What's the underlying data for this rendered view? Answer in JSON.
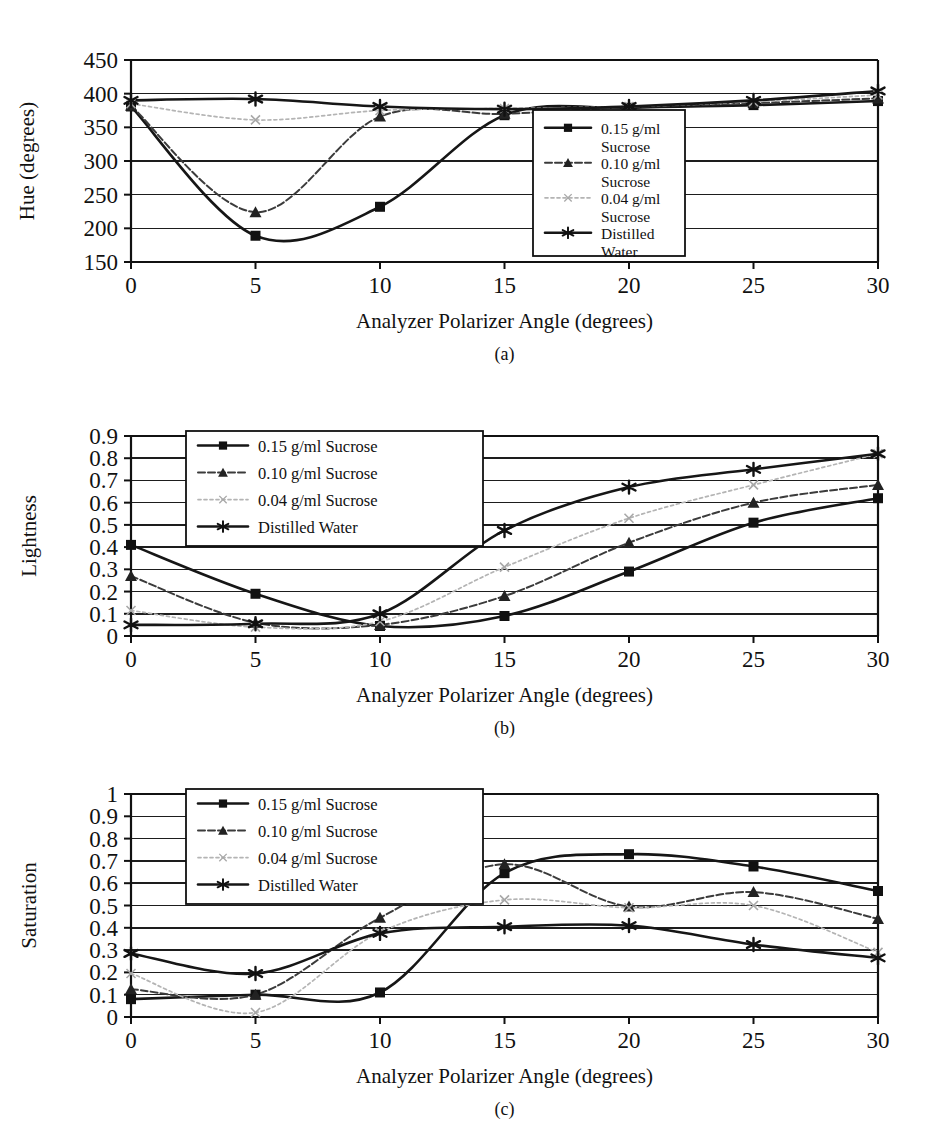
{
  "figure": {
    "x_axis_title": "Analyzer Polarizer Angle (degrees)",
    "x_ticks": [
      "0",
      "5",
      "10",
      "15",
      "20",
      "25",
      "30"
    ],
    "captions": {
      "a": "(a)",
      "b": "(b)",
      "c": "(c)"
    },
    "series_names": {
      "s015": "0.15 g/ml Sucrose",
      "s010": "0.10 g/ml Sucrose",
      "s004": "0.04 g/ml Sucrose",
      "water": "Distilled Water"
    },
    "series_names_wrapped": {
      "s015_l1": "0.15 g/ml",
      "s015_l2": "Sucrose",
      "s010_l1": "0.10 g/ml",
      "s010_l2": "Sucrose",
      "s004_l1": "0.04 g/ml",
      "s004_l2": "Sucrose",
      "water_l1": "Distilled",
      "water_l2": "Water"
    },
    "colors": {
      "s015": "#161616",
      "s010": "#3b3b3b",
      "s004": "#b4b4b4",
      "water": "#111111",
      "axis": "#111111",
      "grid": "#1d1d1d",
      "background": "#ffffff"
    },
    "markers": {
      "s015": "filled-square",
      "s010": "filled-triangle",
      "s004": "small-x",
      "water": "star-asterisk"
    }
  },
  "chart_data": [
    {
      "type": "line",
      "panel": "a",
      "title": "",
      "xlabel": "Analyzer Polarizer Angle (degrees)",
      "ylabel": "Hue (degrees)",
      "xlim": [
        0,
        30
      ],
      "ylim": [
        150,
        450
      ],
      "xticks": [
        0,
        5,
        10,
        15,
        20,
        25,
        30
      ],
      "yticks": [
        150,
        200,
        250,
        300,
        350,
        400,
        450
      ],
      "grid": true,
      "legend_position": "inside-right",
      "x": [
        0,
        5,
        10,
        15,
        20,
        25,
        30
      ],
      "series": [
        {
          "name": "0.15 g/ml Sucrose",
          "values": [
            381,
            189,
            232,
            368,
            379,
            383,
            389
          ]
        },
        {
          "name": "0.10 g/ml Sucrose",
          "values": [
            382,
            224,
            366,
            370,
            380,
            386,
            393
          ]
        },
        {
          "name": "0.04 g/ml Sucrose",
          "values": [
            385,
            361,
            375,
            378,
            381,
            388,
            398
          ]
        },
        {
          "name": "Distilled Water",
          "values": [
            390,
            392,
            381,
            377,
            381,
            390,
            404
          ]
        }
      ]
    },
    {
      "type": "line",
      "panel": "b",
      "title": "",
      "xlabel": "Analyzer Polarizer Angle (degrees)",
      "ylabel": "Lightness",
      "xlim": [
        0,
        30
      ],
      "ylim": [
        0,
        0.9
      ],
      "xticks": [
        0,
        5,
        10,
        15,
        20,
        25,
        30
      ],
      "yticks": [
        0,
        0.1,
        0.2,
        0.3,
        0.4,
        0.5,
        0.6,
        0.7,
        0.8,
        0.9
      ],
      "grid": true,
      "legend_position": "inside-top-left",
      "x": [
        0,
        5,
        10,
        15,
        20,
        25,
        30
      ],
      "series": [
        {
          "name": "0.15 g/ml Sucrose",
          "values": [
            0.41,
            0.19,
            0.045,
            0.09,
            0.29,
            0.51,
            0.62
          ]
        },
        {
          "name": "0.10 g/ml Sucrose",
          "values": [
            0.27,
            0.06,
            0.05,
            0.18,
            0.42,
            0.6,
            0.68
          ]
        },
        {
          "name": "0.04 g/ml Sucrose",
          "values": [
            0.115,
            0.04,
            0.065,
            0.31,
            0.53,
            0.68,
            0.82
          ]
        },
        {
          "name": "Distilled Water",
          "values": [
            0.05,
            0.055,
            0.1,
            0.475,
            0.67,
            0.75,
            0.82
          ]
        }
      ]
    },
    {
      "type": "line",
      "panel": "c",
      "title": "",
      "xlabel": "Analyzer Polarizer Angle (degrees)",
      "ylabel": "Saturation",
      "xlim": [
        0,
        30
      ],
      "ylim": [
        0,
        1
      ],
      "xticks": [
        0,
        5,
        10,
        15,
        20,
        25,
        30
      ],
      "yticks": [
        0,
        0.1,
        0.2,
        0.3,
        0.4,
        0.5,
        0.6,
        0.7,
        0.8,
        0.9,
        1
      ],
      "grid": true,
      "legend_position": "inside-top-left",
      "x": [
        0,
        5,
        10,
        15,
        20,
        25,
        30
      ],
      "series": [
        {
          "name": "0.15 g/ml Sucrose",
          "values": [
            0.08,
            0.1,
            0.11,
            0.645,
            0.73,
            0.675,
            0.565
          ]
        },
        {
          "name": "0.10 g/ml Sucrose",
          "values": [
            0.125,
            0.1,
            0.445,
            0.685,
            0.495,
            0.56,
            0.44
          ]
        },
        {
          "name": "0.04 g/ml Sucrose",
          "values": [
            0.195,
            0.02,
            0.38,
            0.525,
            0.49,
            0.5,
            0.29
          ]
        },
        {
          "name": "Distilled Water",
          "values": [
            0.285,
            0.195,
            0.375,
            0.405,
            0.41,
            0.325,
            0.265
          ]
        }
      ]
    }
  ]
}
